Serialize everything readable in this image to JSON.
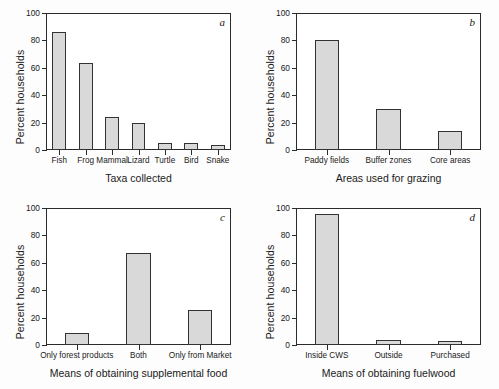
{
  "figure": {
    "shared_ylabel": "Percent households",
    "y_ticks": [
      0,
      20,
      40,
      60,
      80,
      100
    ],
    "y_tick_labels": [
      "0",
      "20",
      "40",
      "60",
      "80",
      "100"
    ]
  },
  "chart_data": [
    {
      "type": "bar",
      "panel": "a",
      "title": "",
      "xlabel": "Taxa collected",
      "ylabel": "Percent households",
      "ylim": [
        0,
        100
      ],
      "yticks": [
        0,
        20,
        40,
        60,
        80,
        100
      ],
      "grid": false,
      "legend": "none",
      "categories": [
        "Fish",
        "Frog",
        "Mammal",
        "Lizard",
        "Turtle",
        "Bird",
        "Snake"
      ],
      "values": [
        85,
        62.5,
        23,
        18.5,
        4.5,
        4,
        2.5
      ]
    },
    {
      "type": "bar",
      "panel": "b",
      "title": "",
      "xlabel": "Areas used for grazing",
      "ylabel": "Percent households",
      "ylim": [
        0,
        100
      ],
      "yticks": [
        0,
        20,
        40,
        60,
        80,
        100
      ],
      "grid": false,
      "legend": "none",
      "categories": [
        "Paddy fields",
        "Buffer zones",
        "Core areas"
      ],
      "values": [
        79.5,
        29,
        13
      ]
    },
    {
      "type": "bar",
      "panel": "c",
      "title": "",
      "xlabel": "Means of obtaining supplemental food",
      "ylabel": "Percent households",
      "ylim": [
        0,
        100
      ],
      "yticks": [
        0,
        20,
        40,
        60,
        80,
        100
      ],
      "grid": false,
      "legend": "none",
      "categories": [
        "Only forest products",
        "Both",
        "Only from Market"
      ],
      "values": [
        7.5,
        66.5,
        24.5
      ]
    },
    {
      "type": "bar",
      "panel": "d",
      "title": "",
      "xlabel": "Means of obtaining fuelwood",
      "ylabel": "Percent households",
      "ylim": [
        0,
        100
      ],
      "yticks": [
        0,
        20,
        40,
        60,
        80,
        100
      ],
      "grid": false,
      "legend": "none",
      "categories": [
        "Inside CWS",
        "Outside",
        "Purchased"
      ],
      "values": [
        94.5,
        3,
        2
      ]
    }
  ],
  "style": {
    "bar_fill": "#d9d9d9",
    "bar_edge": "#333333",
    "axis_color": "#2b2b2b",
    "background": "#ffffff"
  }
}
